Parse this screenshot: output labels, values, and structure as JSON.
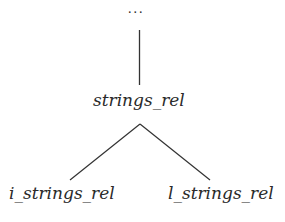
{
  "tree": {
    "ellipsis": "...",
    "root": {
      "label": "strings_rel"
    },
    "children": [
      {
        "label": "i_strings_rel"
      },
      {
        "label": "l_strings_rel"
      }
    ]
  },
  "colors": {
    "line": "#333333",
    "text": "#2a2a2a",
    "background": "#ffffff"
  }
}
